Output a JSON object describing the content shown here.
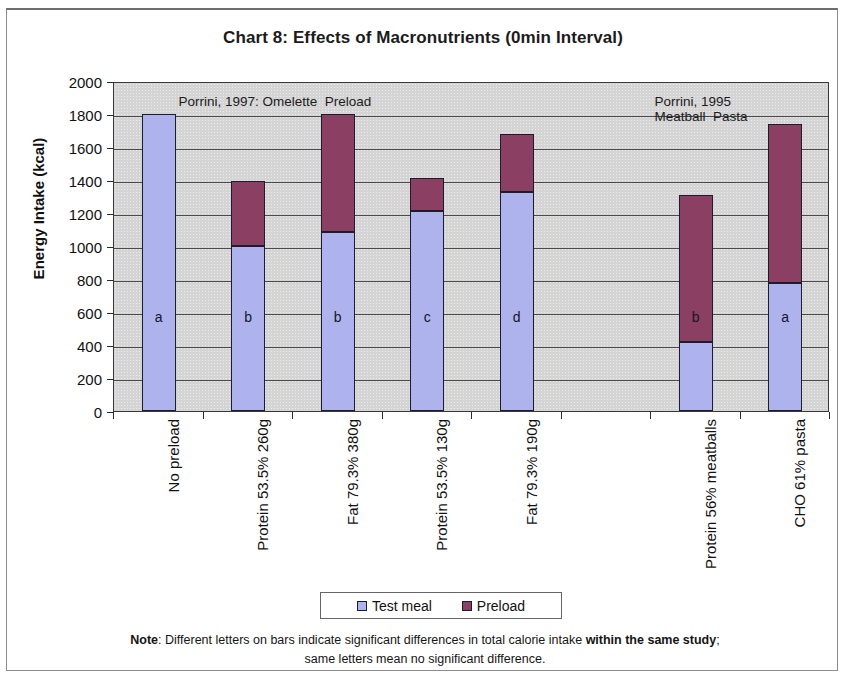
{
  "chart_data": {
    "type": "bar",
    "title": "Chart 8:  Effects of Macronutrients (0min Interval)",
    "xlabel": "",
    "ylabel": "Energy Intake (kcal)",
    "ylim": [
      0,
      2000
    ],
    "ytick_step": 200,
    "yticks": [
      "2000",
      "1800",
      "1600",
      "1400",
      "1200",
      "1000",
      "800",
      "600",
      "400",
      "200",
      "0"
    ],
    "grid": true,
    "stacked": true,
    "legend_position": "bottom",
    "categories": [
      "No preload",
      "Protein 53.5% 260g",
      "Fat 79.3% 380g",
      "Protein 53.5% 130g",
      "Fat 79.3% 190g",
      "",
      "Protein 56% meatballs",
      "CHO 61% pasta"
    ],
    "series": [
      {
        "name": "Test meal",
        "color": "#aeb3ee",
        "values": [
          1800,
          1000,
          1082,
          1210,
          1325,
          null,
          420,
          778
        ]
      },
      {
        "name": "Preload",
        "color": "#8a3f63",
        "values": [
          0,
          392,
          718,
          205,
          355,
          null,
          890,
          962
        ]
      }
    ],
    "totals": [
      1800,
      1392,
      1800,
      1415,
      1680,
      null,
      1310,
      1740
    ],
    "bar_letters": [
      "a",
      "b",
      "b",
      "c",
      "d",
      null,
      "b",
      "a"
    ],
    "annotations": [
      {
        "text": "Porrini, 1997: Omelette  Preload",
        "x_frac": 0.09,
        "y_value": 1880
      },
      {
        "text": "Porrini, 1995",
        "x_frac": 0.755,
        "y_value": 1880
      },
      {
        "text": "Meatball  Pasta",
        "x_frac": 0.755,
        "y_value": 1790
      }
    ]
  },
  "legend": {
    "items": [
      {
        "label": "Test meal",
        "swatch": "test"
      },
      {
        "label": "Preload",
        "swatch": "pre"
      }
    ]
  },
  "footnote": {
    "bold_lead": "Note",
    "line1_a": ": Different letters on bars indicate significant differences in total calorie intake ",
    "line1_bold": "within the same study",
    "line1_b": ";",
    "line2": "same letters mean no significant difference."
  }
}
